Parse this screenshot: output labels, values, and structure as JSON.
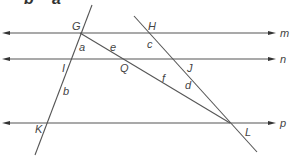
{
  "top_text": {
    "left": "b",
    "right": "a"
  },
  "parallel_lines": [
    {
      "name": "m",
      "y": 33
    },
    {
      "name": "n",
      "y": 59
    },
    {
      "name": "p",
      "y": 123
    }
  ],
  "points": {
    "G": "G",
    "H": "H",
    "I": "I",
    "J": "J",
    "K": "K",
    "L": "L",
    "Q": "Q"
  },
  "angles": {
    "a": "a",
    "b": "b",
    "c": "c",
    "d": "d",
    "e": "e",
    "f": "f"
  },
  "colors": {
    "line": "#555555",
    "arrow": "#333333",
    "label": "#444444"
  }
}
